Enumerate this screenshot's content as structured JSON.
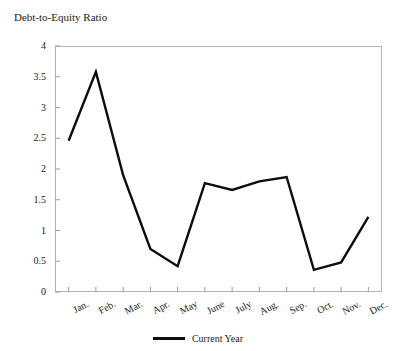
{
  "chart_data": {
    "type": "line",
    "title": "Debt-to-Equity Ratio",
    "xlabel": "",
    "ylabel": "",
    "ylim": [
      0,
      4
    ],
    "yticks": [
      0,
      0.5,
      1,
      1.5,
      2,
      2.5,
      3,
      3.5,
      4
    ],
    "ytick_labels": [
      "0",
      "0.5",
      "1",
      "1.5",
      "2",
      "2.5",
      "3",
      "3.5",
      "4"
    ],
    "categories": [
      "Jan.",
      "Feb.",
      "Mar.",
      "Apr.",
      "May",
      "June",
      "July",
      "Aug.",
      "Sep.",
      "Oct.",
      "Nov.",
      "Dec."
    ],
    "grid": false,
    "legend_position": "bottom",
    "series": [
      {
        "name": "Current Year",
        "color": "#0d0d0d",
        "values": [
          2.46,
          3.58,
          1.9,
          0.7,
          0.42,
          1.77,
          1.66,
          1.8,
          1.87,
          0.36,
          0.48,
          1.22
        ]
      }
    ]
  },
  "legend": {
    "entries": [
      {
        "label": "Current Year"
      }
    ]
  }
}
